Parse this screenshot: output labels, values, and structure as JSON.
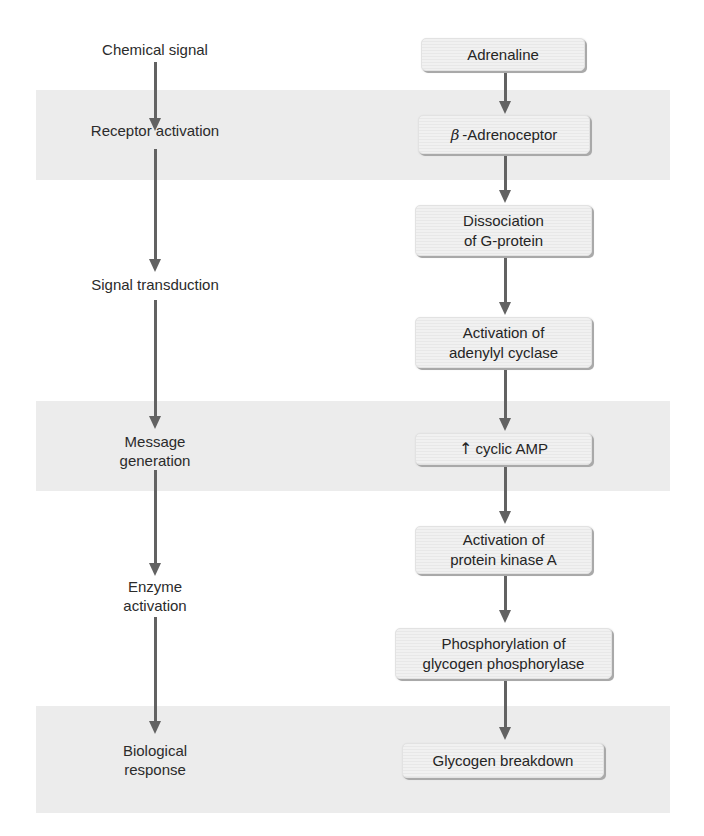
{
  "diagram": {
    "title": "",
    "bands": [
      {
        "name": "receptor-activation-band",
        "top": 90,
        "height": 90
      },
      {
        "name": "message-generation-band",
        "top": 401,
        "height": 90
      },
      {
        "name": "biological-response-band",
        "top": 706,
        "height": 107
      }
    ],
    "stages": [
      {
        "id": "chemical-signal",
        "label": "Chemical signal"
      },
      {
        "id": "receptor-activation",
        "label": "Receptor activation"
      },
      {
        "id": "signal-transduction",
        "label": "Signal transduction"
      },
      {
        "id": "message-generation",
        "label_line1": "Message",
        "label_line2": "generation"
      },
      {
        "id": "enzyme-activation",
        "label_line1": "Enzyme",
        "label_line2": "activation"
      },
      {
        "id": "biological-response",
        "label_line1": "Biological",
        "label_line2": "response"
      }
    ],
    "steps": [
      {
        "id": "adrenaline",
        "label": "Adrenaline"
      },
      {
        "id": "beta-adrenoceptor",
        "prefix": "β",
        "label": "-Adrenoceptor"
      },
      {
        "id": "dissociation-g-protein",
        "label_line1": "Dissociation",
        "label_line2": "of G-protein"
      },
      {
        "id": "activation-adenylyl-cyclase",
        "label_line1": "Activation of",
        "label_line2": "adenylyl cyclase"
      },
      {
        "id": "cyclic-amp",
        "prefix_icon": "↑",
        "label": "cyclic AMP"
      },
      {
        "id": "activation-protein-kinase-a",
        "label_line1": "Activation of",
        "label_line2": "protein kinase A"
      },
      {
        "id": "phosphorylation-glycogen-phosphorylase",
        "label_line1": "Phosphorylation of",
        "label_line2": "glycogen phosphorylase"
      },
      {
        "id": "glycogen-breakdown",
        "label": "Glycogen breakdown"
      }
    ],
    "colors": {
      "band": "#ececec",
      "box_fill": "#f1f1f1",
      "box_shadow": "#a9a9a9",
      "arrow": "#626262",
      "text": "#2b2b2b"
    }
  }
}
